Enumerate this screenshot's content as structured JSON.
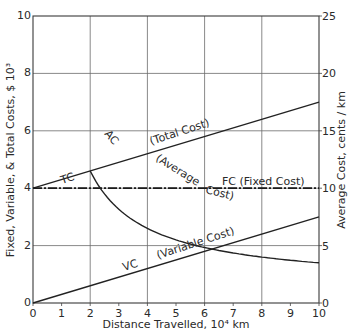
{
  "chart_data": {
    "type": "line",
    "title": "",
    "xlabel": "Distance Travelled,  10⁴ km",
    "ylabel": "Fixed, Variable, & Total Costs,  $ 10³",
    "y2label": "Average Cost,  cents / km",
    "xlim": [
      0,
      10
    ],
    "ylim": [
      0,
      10
    ],
    "y2lim": [
      0,
      25
    ],
    "x_ticks": [
      "0",
      "1",
      "2",
      "3",
      "4",
      "5",
      "6",
      "7",
      "8",
      "9",
      "10"
    ],
    "y_ticks": [
      "0",
      "2",
      "4",
      "6",
      "8",
      "10"
    ],
    "y2_ticks": [
      "0",
      "5",
      "10",
      "15",
      "20",
      "25"
    ],
    "grid": {
      "x": [
        2,
        4,
        6,
        8
      ],
      "y": [
        2,
        4,
        6,
        8
      ]
    },
    "legend": "inline labels",
    "series": [
      {
        "name": "TC (Total Cost)",
        "axis": "left",
        "style": "solid",
        "x": [
          0,
          10
        ],
        "values": [
          4.0,
          7.0
        ]
      },
      {
        "name": "FC (Fixed Cost)",
        "axis": "left",
        "style": "dash-dot",
        "x": [
          0,
          10
        ],
        "values": [
          4.0,
          4.0
        ]
      },
      {
        "name": "VC (Variable Cost)",
        "axis": "left",
        "style": "solid",
        "x": [
          0,
          10
        ],
        "values": [
          0.0,
          3.0
        ]
      },
      {
        "name": "AC (Average Cost)",
        "axis": "right",
        "style": "solid-curve",
        "x": [
          2,
          2.5,
          3,
          3.5,
          4,
          5,
          6,
          7,
          8,
          9,
          10
        ],
        "values": [
          23.0,
          19.0,
          16.3,
          14.4,
          13.0,
          11.0,
          9.7,
          8.7,
          8.0,
          7.4,
          7.0
        ]
      }
    ],
    "annotations": [
      "TC",
      "AC",
      "(Total Cost)",
      "(Average",
      "Cost)",
      "FC  (Fixed Cost)",
      "VC",
      "(Variable Cost)"
    ]
  },
  "labels": {
    "tc": "TC",
    "ac": "AC",
    "total_cost": "(Total  Cost)",
    "average": "(Average",
    "cost": "Cost)",
    "fc": "FC  (Fixed Cost)",
    "vc": "VC",
    "variable_cost": "(Variable Cost)"
  }
}
